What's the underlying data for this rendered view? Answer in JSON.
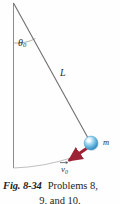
{
  "figure": {
    "kind": "physics-pendulum-diagram",
    "pivot": {
      "x": 13,
      "y": 3
    },
    "vertical_line": {
      "x1": 13,
      "y1": 3,
      "x2": 13,
      "y2": 168
    },
    "string": {
      "label": "L",
      "x1": 13,
      "y1": 3,
      "x2": 91,
      "y2": 143,
      "color": "#6f6f6f"
    },
    "angle": {
      "label": "θ",
      "subscript": "0",
      "arc_radius": 40,
      "value_note": "angle between vertical and string"
    },
    "bob": {
      "label": "m",
      "cx": 91,
      "cy": 143,
      "r": 7,
      "color_light": "#cfeaf8",
      "color_mid": "#63b8e2",
      "color_dark": "#2f8fc4"
    },
    "velocity_vector": {
      "label": "v",
      "subscript": "0",
      "overbar": "arrow",
      "x1": 88,
      "y1": 147,
      "x2": 67,
      "y2": 161,
      "color": "#9e2235"
    },
    "swing_arc": {
      "from_x": 13,
      "from_y": 168,
      "to_x": 72,
      "to_y": 159,
      "color": "#b9b9b9"
    }
  },
  "caption": {
    "figure_number": "Fig. 8-34",
    "text": "Problems 8,",
    "second_line": "9, and 10."
  },
  "colors": {
    "line": "#6f6f6f",
    "arc": "#bdbdbd",
    "vector": "#9e2235",
    "ball": "#63b8e2",
    "text": "#1d1d1d",
    "background": "#fefefe"
  }
}
